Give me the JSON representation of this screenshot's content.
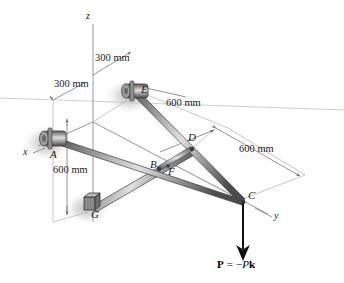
{
  "figure": {
    "type": "3d-statics-free-body-diagram",
    "axes": [
      {
        "name": "x",
        "label": "x"
      },
      {
        "name": "y",
        "label": "y"
      },
      {
        "name": "z",
        "label": "z"
      }
    ],
    "points": [
      {
        "id": "A",
        "label": "A",
        "support": "collar-bearing"
      },
      {
        "id": "B",
        "label": "B",
        "support": "joint"
      },
      {
        "id": "C",
        "label": "C",
        "support": "free-end-load"
      },
      {
        "id": "D",
        "label": "D",
        "support": "joint"
      },
      {
        "id": "E",
        "label": "E",
        "support": "collar-bearing"
      },
      {
        "id": "F",
        "label": "F",
        "support": "joint"
      },
      {
        "id": "G",
        "label": "G",
        "support": "block-bracket"
      }
    ],
    "dimensions": [
      {
        "id": "d1",
        "label": "300 mm"
      },
      {
        "id": "d2",
        "label": "300 mm"
      },
      {
        "id": "d3",
        "label": "600 mm"
      },
      {
        "id": "d4",
        "label": "600 mm"
      },
      {
        "id": "d5",
        "label": "600 mm"
      }
    ],
    "force": {
      "symbol": "P",
      "equals": "=",
      "sign": "−",
      "magnitude": "P",
      "unit_vector": "k",
      "full_label": "P = −Pk"
    },
    "colors": {
      "rod_dark": "#4a4a4a",
      "rod_mid": "#8c8c8c",
      "rod_light": "#d8d8d8",
      "line": "#9a9a9a",
      "text": "#1a1a1a",
      "arrow": "#111111",
      "shadow": "#bdbdbd"
    }
  }
}
